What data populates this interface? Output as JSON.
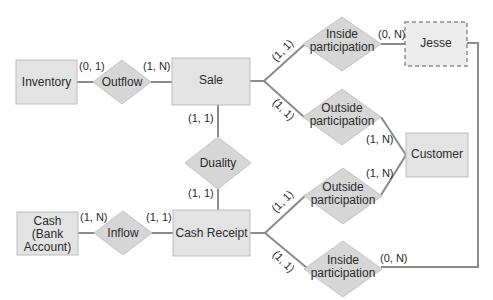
{
  "diagram": {
    "type": "REA entity-relationship diagram",
    "entities": {
      "inventory": "Inventory",
      "sale": "Sale",
      "jesse": "Jesse",
      "customer": "Customer",
      "cash_line1": "Cash",
      "cash_line2": "(Bank",
      "cash_line3": "Account)",
      "cash_receipt": "Cash Receipt"
    },
    "relationships": {
      "outflow": "Outflow",
      "duality": "Duality",
      "inflow": "Inflow",
      "inside_top_l1": "Inside",
      "inside_top_l2": "participation",
      "outside_top_l1": "Outside",
      "outside_top_l2": "participation",
      "outside_bottom_l1": "Outside",
      "outside_bottom_l2": "participation",
      "inside_bottom_l1": "Inside",
      "inside_bottom_l2": "participation"
    },
    "cardinalities": {
      "inventory_outflow": "(0, 1)",
      "outflow_sale": "(1, N)",
      "sale_duality": "(1, 1)",
      "duality_cashreceipt": "(1, 1)",
      "cash_inflow": "(1, N)",
      "inflow_cashreceipt": "(1, 1)",
      "sale_inside": "(1, 1)",
      "inside_jesse": "(0, N)",
      "sale_outside": "(1, 1)",
      "outside_customer_top": "(1, N)",
      "cashreceipt_outside": "(1, 1)",
      "outside_customer_bottom": "(1, N)",
      "cashreceipt_inside": "(1, 1)",
      "inside_jesse_bottom": "(0, N)"
    }
  }
}
